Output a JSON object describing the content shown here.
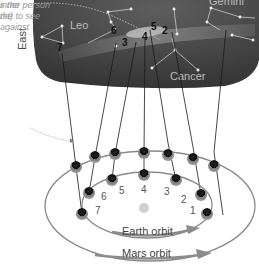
{
  "sky": {
    "direction_label": "East",
    "constellations": [
      "Leo",
      "Gemini",
      "Cancer"
    ],
    "sky_positions": [
      "1",
      "2",
      "3",
      "4",
      "5",
      "6",
      "7"
    ]
  },
  "annotations": {
    "top_note": "s the\nthe",
    "side_note": "inner person\nrst) to see\nagainst"
  },
  "orbits": {
    "earth_label": "Earth orbit",
    "mars_label": "Mars orbit",
    "earth_positions": [
      "1",
      "2",
      "3",
      "4",
      "5",
      "6",
      "7"
    ]
  },
  "colors": {
    "sky_dark": "#3d3d3d",
    "sky_mid": "#5a5a5a",
    "band": "#7a7a7a",
    "orbit_line": "#8a8a8a",
    "sun": "#cfcfcf",
    "arrow": "#8c8c8c"
  }
}
